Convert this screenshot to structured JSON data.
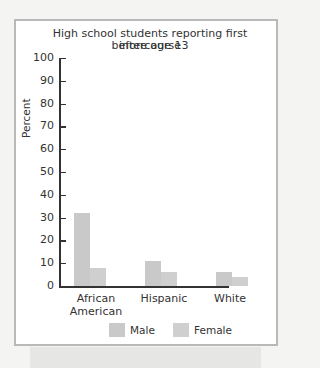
{
  "chart_data": {
    "type": "bar",
    "title_lines": [
      "High school students reporting first intercourse",
      "before age 13"
    ],
    "xlabel": "",
    "ylabel": "Percent",
    "ylim": [
      0,
      100
    ],
    "yticks": [
      0,
      10,
      20,
      30,
      40,
      50,
      60,
      70,
      80,
      90,
      100
    ],
    "categories": [
      "African American",
      "Hispanic",
      "White"
    ],
    "category_lines": [
      [
        "African",
        "American"
      ],
      [
        "Hispanic"
      ],
      [
        "White"
      ]
    ],
    "series": [
      {
        "name": "Male",
        "values": [
          32,
          11,
          6
        ]
      },
      {
        "name": "Female",
        "values": [
          8,
          6,
          4
        ]
      }
    ],
    "grid": false,
    "legend_position": "bottom"
  },
  "legend": {
    "male": "Male",
    "female": "Female"
  },
  "colors": {
    "male": "#c9c9c9",
    "female": "#cfcfcf",
    "frame": "#b9b9b9",
    "axis": "#333333"
  }
}
